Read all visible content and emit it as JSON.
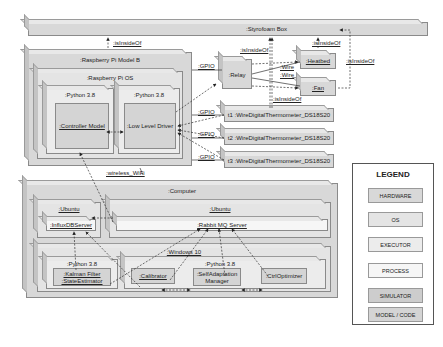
{
  "diagram": {
    "styrofoam_box": ":Styrofoam Box",
    "rpi": ":Raspberry Pi Model B",
    "rpi_os": ":Raspberry Pi OS",
    "python_a": ":Python 3.8",
    "python_b": ":Python 3.8",
    "controller_model": ":Controller Model",
    "low_level_driver": ":Low Level Driver",
    "relay": ":Relay",
    "heatbed": ":Heatbed",
    "fan": ":Fan",
    "t1": "t1 :WireDigitalThermometer_DS18S20",
    "t2": "t2 :WireDigitalThermometer_DS18S20",
    "t3": "t3 :WireDigitalThermometer_DS18S20",
    "computer": ":Computer",
    "ubuntu_a": ":Ubuntu",
    "ubuntu_b": ":Ubuntu",
    "influxdb": ":InfluxDBServer",
    "rabbitmq": ":Rabbit MQ Server",
    "windows": ":Windows 10",
    "python_c": ":Python 3.8",
    "python_d": ":Python 3.8",
    "kalman": ":Kalman Filter\n:StateEstimator",
    "kalman_l1": ":Kalman Filter",
    "kalman_l2": ":StateEstimator",
    "calibrator": ":Calibrator",
    "selfadapt_l1": ":SelfAdaptation",
    "selfadapt_l2": "Manager",
    "ctrl_optimizer": ":CtrlOptimizer",
    "edges": {
      "is_inside_of": ":isInsideOf",
      "gpio": ":GPIO",
      "wire": ":Wire",
      "wireless": ":wireless_WiFi"
    }
  },
  "legend": {
    "title": "LEGEND",
    "items": [
      {
        "label": "HARDWARE"
      },
      {
        "label": "OS"
      },
      {
        "label": "EXECUTOR"
      },
      {
        "label": "PROCESS"
      },
      {
        "label": "SIMULATOR"
      },
      {
        "label": "MODEL / CODE"
      }
    ]
  }
}
